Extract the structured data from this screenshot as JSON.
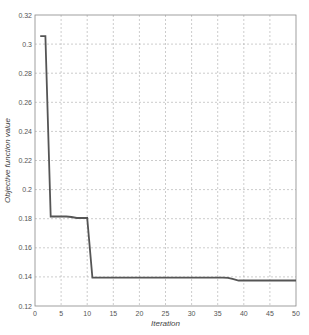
{
  "chart_data": {
    "type": "line",
    "title": "",
    "xlabel": "Iteration",
    "ylabel": "Objective function value",
    "xlim": [
      0,
      50
    ],
    "ylim": [
      0.12,
      0.32
    ],
    "grid": true,
    "legend": null,
    "x_ticks": [
      0,
      5,
      10,
      15,
      20,
      25,
      30,
      35,
      40,
      45,
      50
    ],
    "x_tick_labels": [
      "0",
      "5",
      "10",
      "15",
      "20",
      "25",
      "30",
      "35",
      "40",
      "45",
      "50"
    ],
    "y_ticks": [
      0.12,
      0.14,
      0.16,
      0.18,
      0.2,
      0.22,
      0.24,
      0.26,
      0.28,
      0.3,
      0.32
    ],
    "y_tick_labels": [
      "0.12",
      "0.14",
      "0.16",
      "0.18",
      "0.2",
      "0.22",
      "0.24",
      "0.26",
      "0.28",
      "0.3",
      "0.32"
    ],
    "series": [
      {
        "name": "Objective function value",
        "color": "#555555",
        "x": [
          1,
          2,
          3,
          4,
          5,
          6,
          7,
          8,
          9,
          10,
          11,
          12,
          13,
          14,
          15,
          16,
          17,
          18,
          19,
          20,
          21,
          22,
          23,
          24,
          25,
          26,
          27,
          28,
          29,
          30,
          31,
          32,
          33,
          34,
          35,
          36,
          37,
          38,
          39,
          40,
          41,
          42,
          43,
          44,
          45,
          46,
          47,
          48,
          49,
          50
        ],
        "values": [
          0.3055,
          0.3055,
          0.1815,
          0.1815,
          0.1815,
          0.1815,
          0.1812,
          0.1805,
          0.1805,
          0.1805,
          0.1395,
          0.1395,
          0.1395,
          0.1395,
          0.1395,
          0.1395,
          0.1395,
          0.1395,
          0.1395,
          0.1395,
          0.1395,
          0.1395,
          0.1395,
          0.1395,
          0.1395,
          0.1395,
          0.1395,
          0.1395,
          0.1395,
          0.1395,
          0.1395,
          0.1395,
          0.1395,
          0.1395,
          0.1395,
          0.1395,
          0.1393,
          0.1385,
          0.1375,
          0.1375,
          0.1375,
          0.1375,
          0.1375,
          0.1375,
          0.1375,
          0.1375,
          0.1375,
          0.1375,
          0.1375,
          0.1375
        ]
      }
    ]
  }
}
